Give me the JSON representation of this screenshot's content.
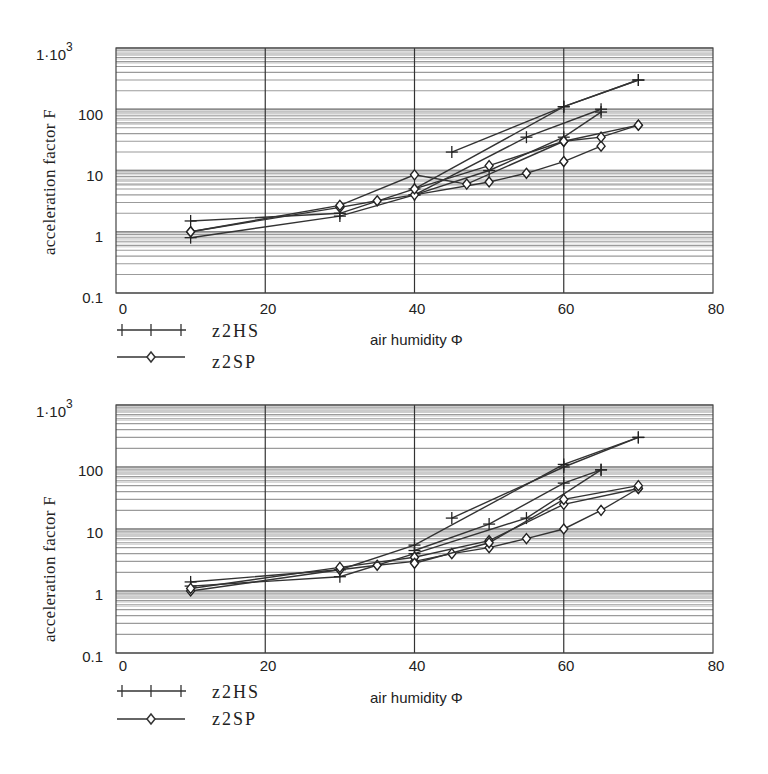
{
  "chart_data": [
    {
      "type": "line",
      "title": "",
      "xlabel": "air humidity Φ",
      "ylabel": "acceleration factor F",
      "yscale": "log",
      "xlim": [
        0,
        80
      ],
      "ylim": [
        0.1,
        1000
      ],
      "x_ticks": [
        "0",
        "20",
        "40",
        "60",
        "80"
      ],
      "y_ticks": [
        "0.1",
        "1",
        "10",
        "100",
        "1·10³"
      ],
      "grid": true,
      "legend_position": "bottom-left",
      "legend": [
        "z2HS",
        "z2SP"
      ],
      "series": [
        {
          "name": "z2HS",
          "marker": "plus",
          "x": [
            10,
            30,
            40,
            60,
            70
          ],
          "values": [
            1.5,
            2.0,
            5.0,
            110,
            300
          ]
        },
        {
          "name": "z2HS",
          "marker": "plus",
          "x": [
            10,
            30,
            40,
            55,
            65
          ],
          "values": [
            0.8,
            1.8,
            4.0,
            35,
            100
          ]
        },
        {
          "name": "z2HS",
          "marker": "plus",
          "x": [
            45,
            60,
            70
          ],
          "values": [
            20,
            110,
            300
          ]
        },
        {
          "name": "z2HS",
          "marker": "plus",
          "x": [
            40,
            50,
            60,
            65
          ],
          "values": [
            4.0,
            10,
            35,
            90
          ]
        },
        {
          "name": "z2SP",
          "marker": "diamond",
          "x": [
            10,
            30,
            35,
            40,
            50,
            55,
            60,
            65
          ],
          "values": [
            1.0,
            2.5,
            3.2,
            4.0,
            6.5,
            9.0,
            14,
            25
          ]
        },
        {
          "name": "z2SP",
          "marker": "diamond",
          "x": [
            10,
            30,
            40,
            47,
            60,
            65,
            70
          ],
          "values": [
            1.0,
            2.7,
            8.5,
            6.0,
            30,
            35,
            55
          ]
        },
        {
          "name": "z2SP",
          "marker": "diamond",
          "x": [
            40,
            50,
            60,
            70
          ],
          "values": [
            5.0,
            12,
            30,
            55
          ]
        }
      ]
    },
    {
      "type": "line",
      "title": "",
      "xlabel": "air humidity Φ",
      "ylabel": "acceleration factor F",
      "yscale": "log",
      "xlim": [
        0,
        80
      ],
      "ylim": [
        0.1,
        1000
      ],
      "x_ticks": [
        "0",
        "20",
        "40",
        "60",
        "80"
      ],
      "y_ticks": [
        "0.1",
        "1",
        "10",
        "100",
        "1·10³"
      ],
      "grid": true,
      "legend_position": "bottom-left",
      "legend": [
        "z2HS",
        "z2SP"
      ],
      "series": [
        {
          "name": "z2HS",
          "marker": "plus",
          "x": [
            10,
            30,
            40,
            60,
            70
          ],
          "values": [
            1.4,
            2.2,
            5.5,
            110,
            300
          ]
        },
        {
          "name": "z2HS",
          "marker": "plus",
          "x": [
            10,
            30,
            40,
            55,
            65
          ],
          "values": [
            1.2,
            1.7,
            4.0,
            15,
            90
          ]
        },
        {
          "name": "z2HS",
          "marker": "plus",
          "x": [
            45,
            60,
            70
          ],
          "values": [
            15,
            100,
            300
          ]
        },
        {
          "name": "z2HS",
          "marker": "plus",
          "x": [
            40,
            50,
            60,
            65
          ],
          "values": [
            4.5,
            12,
            55,
            90
          ]
        },
        {
          "name": "z2SP",
          "marker": "diamond",
          "x": [
            10,
            30,
            35,
            40,
            45,
            50,
            55,
            60,
            65,
            70
          ],
          "values": [
            1.0,
            2.2,
            2.6,
            3.0,
            4.0,
            5.0,
            7.0,
            10,
            20,
            45
          ]
        },
        {
          "name": "z2SP",
          "marker": "diamond",
          "x": [
            10,
            30,
            40,
            50,
            60,
            70
          ],
          "values": [
            1.1,
            2.4,
            3.5,
            6.5,
            25,
            45
          ]
        },
        {
          "name": "z2SP",
          "marker": "diamond",
          "x": [
            40,
            50,
            60,
            70
          ],
          "values": [
            2.8,
            6.0,
            30,
            50
          ]
        }
      ]
    }
  ],
  "charts": [
    {
      "y_axis_label": "acceleration factor F",
      "y_top_label": "1·10",
      "y_top_exp": "3",
      "y_tick_labels": [
        "100",
        "10",
        "1",
        "0.1"
      ],
      "x_tick_labels": [
        "0",
        "20",
        "40",
        "60",
        "80"
      ],
      "x_axis_label": "air humidity Φ",
      "legend": [
        {
          "label": "z2HS",
          "marker": "plus"
        },
        {
          "label": "z2SP",
          "marker": "diamond"
        }
      ]
    },
    {
      "y_axis_label": "acceleration factor F",
      "y_top_label": "1·10",
      "y_top_exp": "3",
      "y_tick_labels": [
        "100",
        "10",
        "1",
        "0.1"
      ],
      "x_tick_labels": [
        "0",
        "20",
        "40",
        "60",
        "80"
      ],
      "x_axis_label": "air humidity Φ",
      "legend": [
        {
          "label": "z2HS",
          "marker": "plus"
        },
        {
          "label": "z2SP",
          "marker": "diamond"
        }
      ]
    }
  ],
  "colors": {
    "line": "#333333",
    "grid": "#8a8a8a",
    "frame": "#444444"
  }
}
